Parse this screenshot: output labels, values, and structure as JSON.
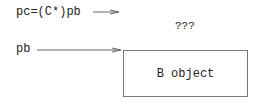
{
  "pointers": {
    "pc_label": "pc=(C*)pb",
    "pb_label": "pb"
  },
  "unknown_label": "???",
  "object_box": {
    "label": "B object"
  }
}
